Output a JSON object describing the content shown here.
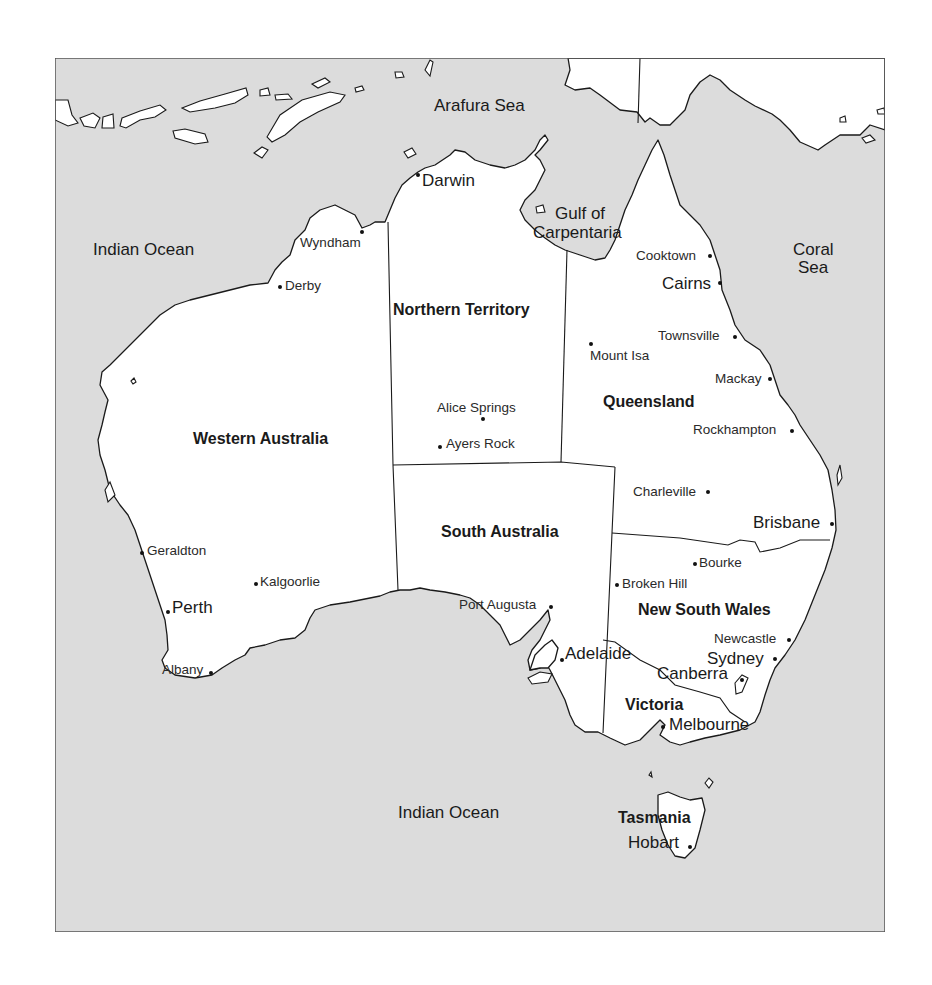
{
  "map": {
    "colors": {
      "sea": "#dcdcdc",
      "land": "#ffffff",
      "outline": "#1a1a1a"
    },
    "seas": [
      {
        "label": "Arafura Sea",
        "x": 434,
        "y": 97
      },
      {
        "label": "Indian Ocean",
        "x": 93,
        "y": 241
      },
      {
        "label": "Gulf of",
        "x": 555,
        "y": 205
      },
      {
        "label": "Carpentaria",
        "x": 533,
        "y": 224
      },
      {
        "label": "Coral",
        "x": 793,
        "y": 241
      },
      {
        "label": "Sea",
        "x": 798,
        "y": 259
      },
      {
        "label": "Indian Ocean",
        "x": 398,
        "y": 804
      }
    ],
    "states": [
      {
        "label": "Northern Territory",
        "x": 393,
        "y": 302
      },
      {
        "label": "Western Australia",
        "x": 193,
        "y": 431
      },
      {
        "label": "Queensland",
        "x": 603,
        "y": 394
      },
      {
        "label": "South Australia",
        "x": 441,
        "y": 524
      },
      {
        "label": "New South Wales",
        "x": 638,
        "y": 602
      },
      {
        "label": "Victoria",
        "x": 625,
        "y": 697
      },
      {
        "label": "Tasmania",
        "x": 618,
        "y": 810
      }
    ],
    "cities": [
      {
        "label": "Darwin",
        "x": 422,
        "y": 172,
        "size": "big",
        "dot": [
          418,
          175
        ]
      },
      {
        "label": "Wyndham",
        "x": 300,
        "y": 236,
        "size": "small",
        "dot": [
          362,
          232
        ]
      },
      {
        "label": "Derby",
        "x": 285,
        "y": 279,
        "size": "small",
        "dot": [
          280,
          287
        ]
      },
      {
        "label": "Cooktown",
        "x": 636,
        "y": 249,
        "size": "small",
        "dot": [
          710,
          256
        ]
      },
      {
        "label": "Cairns",
        "x": 662,
        "y": 275,
        "size": "big",
        "dot": [
          720,
          283
        ]
      },
      {
        "label": "Townsville",
        "x": 658,
        "y": 329,
        "size": "small",
        "dot": [
          735,
          337
        ]
      },
      {
        "label": "Mount Isa",
        "x": 590,
        "y": 349,
        "size": "small",
        "dot": [
          591,
          344
        ]
      },
      {
        "label": "Mackay",
        "x": 715,
        "y": 372,
        "size": "small",
        "dot": [
          770,
          379
        ]
      },
      {
        "label": "Alice Springs",
        "x": 437,
        "y": 401,
        "size": "small",
        "dot": [
          483,
          419
        ]
      },
      {
        "label": "Rockhampton",
        "x": 693,
        "y": 423,
        "size": "small",
        "dot": [
          792,
          431
        ]
      },
      {
        "label": "Ayers Rock",
        "x": 446,
        "y": 437,
        "size": "small",
        "dot": [
          440,
          447
        ]
      },
      {
        "label": "Charleville",
        "x": 633,
        "y": 485,
        "size": "small",
        "dot": [
          708,
          492
        ]
      },
      {
        "label": "Brisbane",
        "x": 753,
        "y": 514,
        "size": "big",
        "dot": [
          832,
          524
        ]
      },
      {
        "label": "Geraldton",
        "x": 147,
        "y": 544,
        "size": "small",
        "dot": [
          142,
          553
        ]
      },
      {
        "label": "Bourke",
        "x": 699,
        "y": 556,
        "size": "small",
        "dot": [
          695,
          564
        ]
      },
      {
        "label": "Kalgoorlie",
        "x": 260,
        "y": 575,
        "size": "small",
        "dot": [
          256,
          584
        ]
      },
      {
        "label": "Broken Hill",
        "x": 622,
        "y": 577,
        "size": "small",
        "dot": [
          617,
          585
        ]
      },
      {
        "label": "Perth",
        "x": 172,
        "y": 599,
        "size": "big",
        "dot": [
          168,
          612
        ]
      },
      {
        "label": "Port Augusta",
        "x": 459,
        "y": 598,
        "size": "small",
        "dot": [
          551,
          607
        ]
      },
      {
        "label": "Newcastle",
        "x": 714,
        "y": 632,
        "size": "small",
        "dot": [
          789,
          640
        ]
      },
      {
        "label": "Adelaide",
        "x": 565,
        "y": 645,
        "size": "big",
        "dot": [
          562,
          660
        ]
      },
      {
        "label": "Sydney",
        "x": 707,
        "y": 650,
        "size": "big",
        "dot": [
          775,
          659
        ]
      },
      {
        "label": "Albany",
        "x": 162,
        "y": 663,
        "size": "small",
        "dot": [
          211,
          673
        ]
      },
      {
        "label": "Canberra",
        "x": 657,
        "y": 665,
        "size": "big",
        "dot": [
          742,
          680
        ]
      },
      {
        "label": "Melbourne",
        "x": 669,
        "y": 716,
        "size": "big",
        "dot": [
          663,
          727
        ]
      },
      {
        "label": "Hobart",
        "x": 628,
        "y": 834,
        "size": "big",
        "dot": [
          690,
          847
        ]
      }
    ]
  }
}
